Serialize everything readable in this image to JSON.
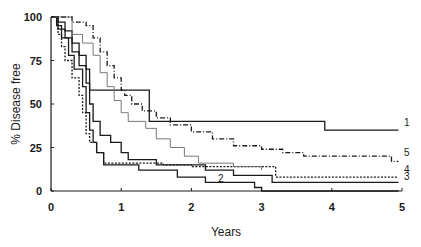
{
  "chart_data": {
    "type": "line",
    "subtype": "kaplan-meier step curves",
    "title": "",
    "xlabel": "Years",
    "ylabel": "% Disease free",
    "xlim": [
      0,
      5
    ],
    "ylim": [
      0,
      100
    ],
    "x_ticks": [
      "0",
      "1",
      "2",
      "3",
      "4",
      "5"
    ],
    "y_ticks": [
      "0",
      "25",
      "50",
      "75",
      "100"
    ],
    "grid": false,
    "legend": "inline numeric labels at curve ends",
    "series": [
      {
        "name": "1",
        "style": "solid",
        "labelPos": [
          5.0,
          36
        ],
        "points": [
          [
            0,
            100
          ],
          [
            0.1,
            97
          ],
          [
            0.2,
            92
          ],
          [
            0.3,
            85
          ],
          [
            0.4,
            78
          ],
          [
            0.5,
            70
          ],
          [
            0.55,
            58
          ],
          [
            1.4,
            58
          ],
          [
            1.4,
            40
          ],
          [
            3.9,
            40
          ],
          [
            3.9,
            35
          ],
          [
            4.95,
            35
          ]
        ]
      },
      {
        "name": "2",
        "style": "solid",
        "labelPos": [
          2.35,
          4
        ],
        "points": [
          [
            0,
            100
          ],
          [
            0.08,
            95
          ],
          [
            0.15,
            88
          ],
          [
            0.25,
            78
          ],
          [
            0.33,
            70
          ],
          [
            0.45,
            60
          ],
          [
            0.5,
            45
          ],
          [
            0.55,
            35
          ],
          [
            0.6,
            28
          ],
          [
            0.65,
            22
          ],
          [
            0.75,
            15
          ],
          [
            1.25,
            15
          ],
          [
            1.25,
            12
          ],
          [
            1.8,
            12
          ],
          [
            1.8,
            8
          ],
          [
            2.2,
            8
          ],
          [
            2.2,
            5
          ],
          [
            2.9,
            5
          ],
          [
            2.9,
            2
          ],
          [
            3.0,
            2
          ],
          [
            3.0,
            0
          ],
          [
            4.95,
            0
          ]
        ]
      },
      {
        "name": "3",
        "style": "solid",
        "labelPos": [
          5.0,
          5
        ],
        "points": [
          [
            0,
            100
          ],
          [
            0.1,
            93
          ],
          [
            0.2,
            88
          ],
          [
            0.3,
            80
          ],
          [
            0.4,
            72
          ],
          [
            0.5,
            62
          ],
          [
            0.55,
            50
          ],
          [
            0.6,
            40
          ],
          [
            0.7,
            32
          ],
          [
            0.85,
            28
          ],
          [
            1.0,
            22
          ],
          [
            1.1,
            18
          ],
          [
            1.5,
            15
          ],
          [
            2.2,
            12
          ],
          [
            2.6,
            12
          ],
          [
            2.6,
            9
          ],
          [
            3.15,
            9
          ],
          [
            3.15,
            5
          ],
          [
            4.95,
            5
          ]
        ]
      },
      {
        "name": "4",
        "style": "dotted",
        "labelPos": [
          5.0,
          9
        ],
        "points": [
          [
            0,
            100
          ],
          [
            0.1,
            90
          ],
          [
            0.15,
            83
          ],
          [
            0.2,
            75
          ],
          [
            0.3,
            65
          ],
          [
            0.4,
            55
          ],
          [
            0.45,
            45
          ],
          [
            0.5,
            33
          ],
          [
            0.55,
            28
          ],
          [
            0.65,
            22
          ],
          [
            0.75,
            16
          ],
          [
            1.0,
            16
          ],
          [
            1.6,
            15
          ],
          [
            2.0,
            14
          ],
          [
            2.5,
            14
          ],
          [
            3.2,
            14
          ],
          [
            3.2,
            8
          ],
          [
            4.95,
            8
          ]
        ]
      },
      {
        "name": "5",
        "style": "dash-dot",
        "labelPos": [
          5.0,
          19
        ],
        "points": [
          [
            0,
            100
          ],
          [
            0.2,
            100
          ],
          [
            0.3,
            97
          ],
          [
            0.5,
            95
          ],
          [
            0.6,
            88
          ],
          [
            0.7,
            80
          ],
          [
            0.8,
            72
          ],
          [
            0.9,
            65
          ],
          [
            1.0,
            58
          ],
          [
            1.05,
            55
          ],
          [
            1.15,
            50
          ],
          [
            1.3,
            46
          ],
          [
            1.5,
            42
          ],
          [
            1.7,
            38
          ],
          [
            2.0,
            34
          ],
          [
            2.3,
            30
          ],
          [
            2.6,
            26
          ],
          [
            3.0,
            24
          ],
          [
            3.3,
            22
          ],
          [
            3.6,
            20
          ],
          [
            4.85,
            20
          ],
          [
            4.85,
            17
          ],
          [
            4.95,
            17
          ]
        ]
      },
      {
        "name": "",
        "style": "light-solid",
        "labelPos": null,
        "points": [
          [
            0,
            100
          ],
          [
            0.2,
            100
          ],
          [
            0.3,
            90
          ],
          [
            0.45,
            85
          ],
          [
            0.6,
            78
          ],
          [
            0.7,
            68
          ],
          [
            0.8,
            60
          ],
          [
            0.9,
            52
          ],
          [
            1.0,
            45
          ],
          [
            1.1,
            40
          ],
          [
            1.35,
            36
          ],
          [
            1.5,
            30
          ],
          [
            1.7,
            25
          ],
          [
            1.9,
            20
          ],
          [
            2.1,
            16
          ],
          [
            2.6,
            14
          ],
          [
            3.0,
            12
          ]
        ]
      }
    ]
  }
}
